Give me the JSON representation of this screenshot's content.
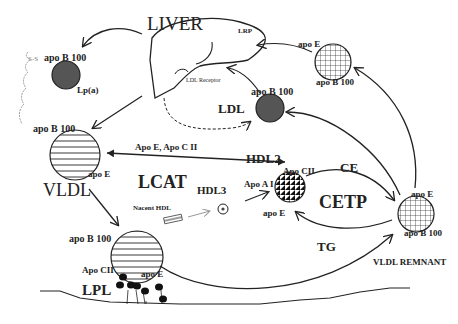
{
  "diagram": {
    "type": "lipoprotein-metabolism-pathway",
    "organ": {
      "label": "LIVER",
      "receptors": [
        "LRP",
        "LDL Receptor"
      ]
    },
    "particles": [
      {
        "id": "lpa",
        "label": "Lp(a)",
        "apo": [
          "apo B 100"
        ],
        "bond": "S-S",
        "fill": "dark-solid"
      },
      {
        "id": "vldl",
        "label": "VLDL",
        "apo": [
          "apo B 100",
          "apo E"
        ],
        "fill": "horizontal-stripes"
      },
      {
        "id": "ldl",
        "label": "LDL",
        "apo": [
          "apo B 100"
        ],
        "fill": "dark-solid"
      },
      {
        "id": "idl_top",
        "label": "",
        "apo": [
          "apo E",
          "apo B 100"
        ],
        "fill": "grid"
      },
      {
        "id": "hdl3",
        "label": "HDL3",
        "apo": [],
        "fill": "small-flower"
      },
      {
        "id": "nacent_hdl",
        "label": "Nacent HDL",
        "apo": [],
        "fill": "disc"
      },
      {
        "id": "hdl2",
        "label": "HDL2",
        "apo": [
          "Apo CII",
          "Apo A I",
          "apo E"
        ],
        "fill": "triangles"
      },
      {
        "id": "vldl_remnant",
        "label": "VLDL REMNANT",
        "apo": [
          "apo E",
          "apo B 100"
        ],
        "fill": "grid"
      },
      {
        "id": "chylo_vldl",
        "label": "",
        "apo": [
          "apo B 100",
          "Apo CII",
          "apo E"
        ],
        "fill": "horizontal-stripes"
      }
    ],
    "enzymes": [
      "LCAT",
      "CETP",
      "LPL"
    ],
    "exchange": {
      "to_remnant": "CE",
      "to_hdl": "TG"
    },
    "transfer_label": "Apo E, Apo C II"
  },
  "labels": {
    "liver": "LIVER",
    "lrp": "LRP",
    "ldl_receptor": "LDL Receptor",
    "ss": "S-S",
    "lpa_apo": "apo B 100",
    "lpa": "Lp(a)",
    "vldl_apo_b": "apo B 100",
    "vldl_apo_e": "apo E",
    "vldl": "VLDL",
    "transfer": "Apo E, Apo C II",
    "ldl_apo": "apo B 100",
    "ldl": "LDL",
    "idl_apo_e": "apo E",
    "idl_apo_b": "apo B 100",
    "lcat": "LCAT",
    "hdl2": "HDL2",
    "hdl3": "HDL3",
    "nacent_hdl": "Nacent HDL",
    "hdl_apo_cii": "Apo CII",
    "hdl_apo_ai": "Apo A I",
    "hdl_apo_e": "apo E",
    "ce": "CE",
    "cetp": "CETP",
    "tg": "TG",
    "rem_apo_e": "apo E",
    "rem_apo_b": "apo B 100",
    "vldl_remnant": "VLDL REMNANT",
    "chylo_apo_b": "apo B 100",
    "chylo_apo_cii": "Apo CII",
    "chylo_apo_e": "apo E",
    "lpl": "LPL"
  },
  "colors": {
    "ink": "#222222",
    "dark_fill": "#555555",
    "grey_arrow": "#999999"
  }
}
